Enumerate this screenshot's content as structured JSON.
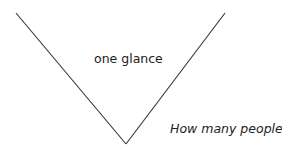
{
  "diagram": {
    "center_label": "one glance",
    "side_label": "How many people?",
    "line_color": "#333333",
    "shape": "v-shape"
  }
}
